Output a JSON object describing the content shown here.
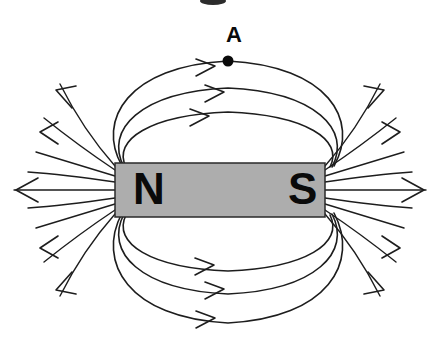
{
  "figure": {
    "background_color": "#ffffff",
    "stroke_color": "#1d1d1d",
    "width": 438,
    "height": 349
  },
  "magnet": {
    "fill_color": "#adadad",
    "border_color": "#2a2a2a",
    "x": 115,
    "y": 163,
    "width": 210,
    "height": 54,
    "north_label": "N",
    "south_label": "S",
    "label_color": "#0a0a0a"
  },
  "point_marker": {
    "label": "A",
    "x": 228,
    "y": 61,
    "label_x": 234,
    "label_y": 42,
    "radius": 5.5,
    "color": "#0a0a0a"
  },
  "top_loops": [
    {
      "id": "top-loop-outer",
      "path": "M 122 166 C 96 120, 128 66, 228 61 C 328 66, 360 120, 334 166",
      "arrow": "M 196 59 L 215 66 L 196 76"
    },
    {
      "id": "top-loop-middle",
      "path": "M 124 167 C 104 130, 140 92, 228 88 C 316 92, 352 130, 332 167",
      "arrow": "M 205 85 L 224 92 L 205 102"
    },
    {
      "id": "top-loop-inner",
      "path": "M 126 167 C 112 140, 150 115, 228 112 C 306 115, 344 140, 330 167",
      "arrow": "M 190 109 L 209 116 L 190 126"
    }
  ],
  "bottom_loops": [
    {
      "id": "bottom-loop-inner",
      "path": "M 126 215 C 112 243, 150 268, 228 271 C 306 268, 344 243, 330 215",
      "arrow": "M 195 258 L 214 265 L 195 275"
    },
    {
      "id": "bottom-loop-middle",
      "path": "M 124 214 C 104 252, 140 290, 228 294 C 316 290, 352 252, 332 214",
      "arrow": "M 205 282 L 224 289 L 205 299"
    },
    {
      "id": "bottom-loop-outer",
      "path": "M 122 213 C 96 262, 128 318, 228 323 C 328 318, 360 262, 334 213",
      "arrow": "M 196 311 L 215 318 L 196 328"
    }
  ],
  "left_lines": [
    {
      "id": "left-fan-1",
      "path": "M 115 166 C 92 140, 74 112, 60 84"
    },
    {
      "id": "left-fan-2",
      "path": "M 115 170 C 88 152, 64 134, 44 118"
    },
    {
      "id": "left-fan-3",
      "path": "M 115 176 C 88 168, 62 160, 36 152"
    },
    {
      "id": "left-fan-4",
      "path": "M 115 182 C 88 178, 58 174, 28 172"
    },
    {
      "id": "left-fan-5",
      "path": "M 115 190 L 14 190"
    },
    {
      "id": "left-fan-6",
      "path": "M 115 198 C 88 202, 58 206, 28 208"
    },
    {
      "id": "left-fan-7",
      "path": "M 115 204 C 88 212, 62 220, 36 228"
    },
    {
      "id": "left-fan-8",
      "path": "M 115 210 C 88 228, 64 246, 44 262"
    },
    {
      "id": "left-fan-9",
      "path": "M 115 214 C 92 240, 74 268, 60 296"
    }
  ],
  "left_arrows": [
    {
      "id": "left-arrow-upper-1",
      "path": "M 72 108 L 56 90 L 76 86"
    },
    {
      "id": "left-arrow-upper-2",
      "path": "M 58 144 L 40 132 L 58 122"
    },
    {
      "id": "left-arrow-center",
      "path": "M 38 178 L 16 190 L 38 202"
    },
    {
      "id": "left-arrow-lower-1",
      "path": "M 58 236 L 40 248 L 58 258"
    },
    {
      "id": "left-arrow-lower-2",
      "path": "M 72 272 L 56 290 L 76 294"
    }
  ],
  "right_lines": [
    {
      "id": "right-fan-1",
      "path": "M 325 166 C 348 140, 366 112, 380 84"
    },
    {
      "id": "right-fan-2",
      "path": "M 325 170 C 352 152, 376 134, 396 118"
    },
    {
      "id": "right-fan-3",
      "path": "M 325 176 C 352 168, 378 160, 404 152"
    },
    {
      "id": "right-fan-4",
      "path": "M 325 182 C 352 178, 382 174, 412 172"
    },
    {
      "id": "right-fan-5",
      "path": "M 325 190 L 426 190"
    },
    {
      "id": "right-fan-6",
      "path": "M 325 198 C 352 202, 382 206, 412 208"
    },
    {
      "id": "right-fan-7",
      "path": "M 325 204 C 352 212, 378 220, 404 228"
    },
    {
      "id": "right-fan-8",
      "path": "M 325 210 C 352 228, 376 246, 396 262"
    },
    {
      "id": "right-fan-9",
      "path": "M 325 214 C 348 240, 366 268, 380 296"
    }
  ],
  "right_arrows": [
    {
      "id": "right-arrow-upper-1",
      "path": "M 368 108 L 384 90 L 364 86"
    },
    {
      "id": "right-arrow-upper-2",
      "path": "M 382 144 L 400 132 L 382 122"
    },
    {
      "id": "right-arrow-center",
      "path": "M 402 178 L 424 190 L 402 202"
    },
    {
      "id": "right-arrow-lower-1",
      "path": "M 382 236 L 400 248 L 382 258"
    },
    {
      "id": "right-arrow-lower-2",
      "path": "M 368 272 L 384 290 L 364 294"
    }
  ],
  "top_edge_artifact": {
    "present": true,
    "x": 200,
    "width": 26,
    "height": 4
  }
}
